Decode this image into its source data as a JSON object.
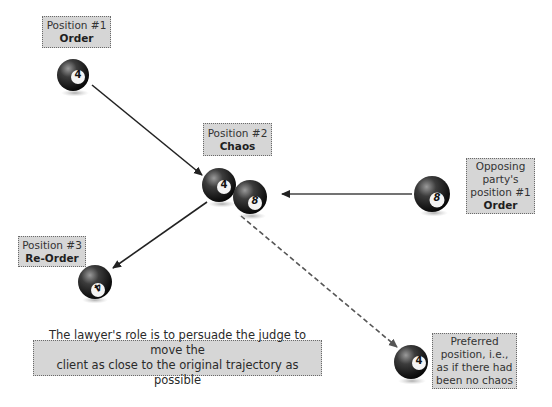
{
  "labels": {
    "position1": {
      "line1": "Position #1",
      "line2": "Order"
    },
    "position2": {
      "line1": "Position #2",
      "line2": "Chaos"
    },
    "position3": {
      "line1": "Position #3",
      "line2": "Re-Order"
    },
    "opposing": {
      "line1": "Opposing",
      "line2": "party's",
      "line3": "position #1",
      "line4": "Order"
    },
    "preferred": {
      "line1": "Preferred",
      "line2": "position, i.e.,",
      "line3": "as if there had",
      "line4": "been no chaos"
    },
    "statement": {
      "line1": "The lawyer's role is to persuade the judge to move the",
      "line2": "client as close to the original trajectory as possible"
    }
  },
  "balls": {
    "ball_pos1": {
      "number": "4"
    },
    "ball_chaos_4": {
      "number": "4"
    },
    "ball_chaos_8": {
      "number": "8"
    },
    "ball_opposing": {
      "number": "8"
    },
    "ball_pos3": {
      "number": "4"
    },
    "ball_preferred": {
      "number": "4"
    }
  },
  "colors": {
    "box_fill": "#d6d6d6",
    "box_border": "#6a6a6a",
    "arrow_solid": "#222222",
    "arrow_dashed": "#555555",
    "ball_dark": "#1a1a1a"
  }
}
